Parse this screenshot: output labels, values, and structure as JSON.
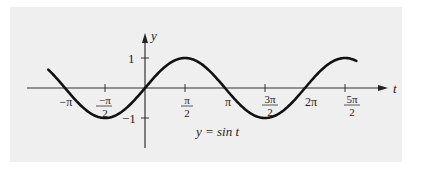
{
  "chart_data": {
    "type": "line",
    "title": "",
    "caption": "y = sin t",
    "xlabel": "t",
    "ylabel": "y",
    "function": "sin(t)",
    "x_range": [
      -3.8,
      8.3
    ],
    "ylim": [
      -1,
      1
    ],
    "grid": false,
    "legend": null,
    "x_ticks": [
      {
        "value": -3.14159,
        "label": "−π"
      },
      {
        "value": -1.5708,
        "label": "−π/2"
      },
      {
        "value": 1.5708,
        "label": "π/2"
      },
      {
        "value": 3.14159,
        "label": "π"
      },
      {
        "value": 4.71239,
        "label": "3π/2"
      },
      {
        "value": 6.28319,
        "label": "2π"
      },
      {
        "value": 7.85398,
        "label": "5π/2"
      }
    ],
    "y_ticks": [
      {
        "value": 1,
        "label": "1"
      },
      {
        "value": -1,
        "label": "−1"
      }
    ],
    "x": [
      -3.8,
      -3.14159,
      -1.5708,
      0,
      1.5708,
      3.14159,
      4.71239,
      6.28319,
      7.85398,
      8.3
    ],
    "values": [
      0.61,
      0,
      -1,
      0,
      1,
      0,
      -1,
      0,
      1,
      0.9
    ]
  },
  "labels": {
    "y_axis": "y",
    "t_axis": "t",
    "one": "1",
    "minus_one": "−1",
    "neg_pi": "−π",
    "neg_pi_half_num": "−π",
    "neg_pi_half_den": "2",
    "pi_half_num": "π",
    "pi_half_den": "2",
    "pi": "π",
    "three_pi_half_num": "3π",
    "three_pi_half_den": "2",
    "two_pi": "2π",
    "five_pi_half_num": "5π",
    "five_pi_half_den": "2",
    "caption": "y = sin t"
  },
  "colors": {
    "background": "#ffffff",
    "panel": "#efefef",
    "curve": "#111111",
    "axis": "#333333"
  }
}
